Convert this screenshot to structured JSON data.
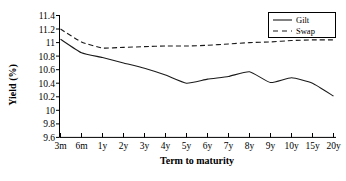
{
  "chart_data": {
    "type": "line",
    "title": "",
    "xlabel": "Term to maturity",
    "ylabel": "Yield (%)",
    "categories": [
      "3m",
      "6m",
      "1y",
      "2y",
      "3y",
      "4y",
      "5y",
      "6y",
      "7y",
      "8y",
      "9y",
      "10y",
      "15y",
      "20y"
    ],
    "ylim": [
      9.6,
      11.4
    ],
    "yticks": [
      "11.4",
      "11.2",
      "11",
      "10.8",
      "10.6",
      "10.4",
      "10.2",
      "10",
      "9.8",
      "9.6"
    ],
    "ytick_values": [
      11.4,
      11.2,
      11.0,
      10.8,
      10.6,
      10.4,
      10.2,
      10.0,
      9.8,
      9.6
    ],
    "grid": false,
    "legend_position": "top-right",
    "series": [
      {
        "name": "Gilt",
        "style": "solid",
        "color": "#1a1a1a",
        "values": [
          11.05,
          10.85,
          10.78,
          10.7,
          10.62,
          10.52,
          10.4,
          10.46,
          10.5,
          10.57,
          10.41,
          10.48,
          10.4,
          10.21
        ]
      },
      {
        "name": "Swap",
        "style": "dashed",
        "color": "#1a1a1a",
        "values": [
          11.2,
          11.01,
          10.92,
          10.93,
          10.94,
          10.95,
          10.95,
          10.96,
          10.98,
          11.0,
          11.01,
          11.03,
          11.04,
          11.04
        ]
      }
    ]
  },
  "legend": {
    "items": [
      {
        "label": "Gilt",
        "style": "solid"
      },
      {
        "label": "Swap",
        "style": "dashed"
      }
    ]
  },
  "axes": {
    "x_title": "Term to maturity",
    "y_title": "Yield (%)"
  }
}
